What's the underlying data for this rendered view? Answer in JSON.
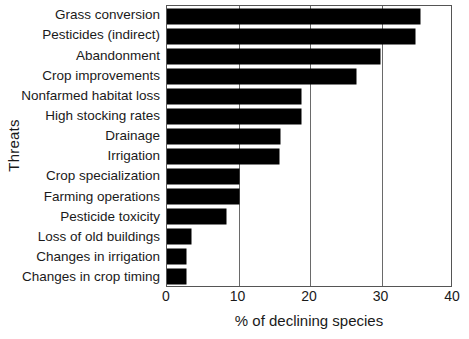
{
  "chart_data": {
    "type": "bar",
    "orientation": "horizontal",
    "title": "",
    "xlabel": "% of declining species",
    "ylabel": "Threats",
    "xlim": [
      0,
      40
    ],
    "xticks": [
      0,
      10,
      20,
      30,
      40
    ],
    "grid": "vertical",
    "legend": null,
    "bar_color": "#000000",
    "categories": [
      "Grass conversion",
      "Pesticides (indirect)",
      "Abandonment",
      "Crop improvements",
      "Nonfarmed habitat loss",
      "High stocking rates",
      "Drainage",
      "Irrigation",
      "Crop specialization",
      "Farming operations",
      "Pesticide toxicity",
      "Loss of old buildings",
      "Changes in irrigation",
      "Changes in crop timing"
    ],
    "values": [
      35.4,
      34.7,
      29.8,
      26.5,
      18.8,
      18.8,
      15.8,
      15.7,
      10.0,
      10.0,
      8.2,
      3.4,
      2.6,
      2.6
    ]
  }
}
